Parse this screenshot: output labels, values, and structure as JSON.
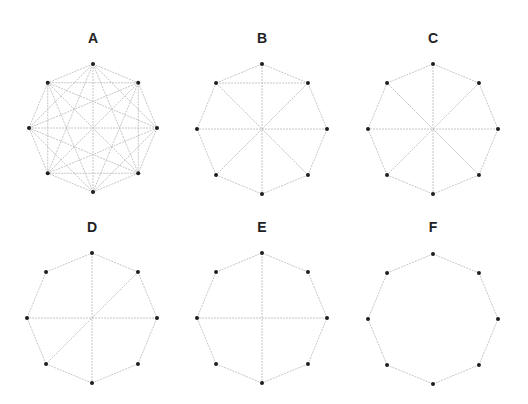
{
  "figure": {
    "vertex_order": [
      "top",
      "top-right",
      "right",
      "bottom-right",
      "bottom",
      "bottom-left",
      "left",
      "top-left"
    ],
    "colors": {
      "edge": "#b8b8b8",
      "vertex": "#1e1e1e",
      "label": "#222222",
      "background": "#ffffff"
    },
    "graphs": [
      {
        "label": "A",
        "center": [
          93,
          128
        ],
        "radius": 64,
        "label_pos": [
          93,
          43
        ],
        "edge_type": "complete",
        "edges": "all"
      },
      {
        "label": "B",
        "center": [
          262,
          129
        ],
        "radius": 65,
        "label_pos": [
          262,
          43
        ],
        "edge_type": "list",
        "edges": [
          [
            0,
            1
          ],
          [
            1,
            2
          ],
          [
            2,
            3
          ],
          [
            3,
            4
          ],
          [
            4,
            5
          ],
          [
            5,
            6
          ],
          [
            6,
            7
          ],
          [
            7,
            0
          ],
          [
            0,
            4
          ],
          [
            1,
            5
          ],
          [
            2,
            6
          ],
          [
            3,
            7
          ],
          [
            7,
            1
          ]
        ]
      },
      {
        "label": "C",
        "center": [
          433,
          129
        ],
        "radius": 65,
        "label_pos": [
          433,
          43
        ],
        "edge_type": "list",
        "edges": [
          [
            0,
            1
          ],
          [
            1,
            2
          ],
          [
            2,
            3
          ],
          [
            3,
            4
          ],
          [
            4,
            5
          ],
          [
            5,
            6
          ],
          [
            6,
            7
          ],
          [
            7,
            0
          ],
          [
            0,
            4
          ],
          [
            1,
            5
          ],
          [
            2,
            6
          ],
          [
            3,
            7
          ]
        ]
      },
      {
        "label": "D",
        "center": [
          92,
          318
        ],
        "radius": 65,
        "label_pos": [
          92,
          232
        ],
        "edge_type": "list",
        "edges": [
          [
            0,
            1
          ],
          [
            1,
            2
          ],
          [
            2,
            3
          ],
          [
            3,
            4
          ],
          [
            4,
            5
          ],
          [
            5,
            6
          ],
          [
            6,
            7
          ],
          [
            7,
            0
          ],
          [
            0,
            4
          ],
          [
            2,
            6
          ],
          [
            1,
            5
          ]
        ]
      },
      {
        "label": "E",
        "center": [
          262,
          318
        ],
        "radius": 65,
        "label_pos": [
          262,
          232
        ],
        "edge_type": "list",
        "edges": [
          [
            0,
            1
          ],
          [
            1,
            2
          ],
          [
            2,
            3
          ],
          [
            3,
            4
          ],
          [
            4,
            5
          ],
          [
            5,
            6
          ],
          [
            6,
            7
          ],
          [
            7,
            0
          ],
          [
            0,
            4
          ],
          [
            2,
            6
          ]
        ]
      },
      {
        "label": "F",
        "center": [
          433,
          319
        ],
        "radius": 65,
        "label_pos": [
          433,
          232
        ],
        "edge_type": "list",
        "edges": [
          [
            0,
            1
          ],
          [
            1,
            2
          ],
          [
            2,
            3
          ],
          [
            3,
            4
          ],
          [
            4,
            5
          ],
          [
            5,
            6
          ],
          [
            6,
            7
          ],
          [
            7,
            0
          ]
        ]
      }
    ]
  }
}
